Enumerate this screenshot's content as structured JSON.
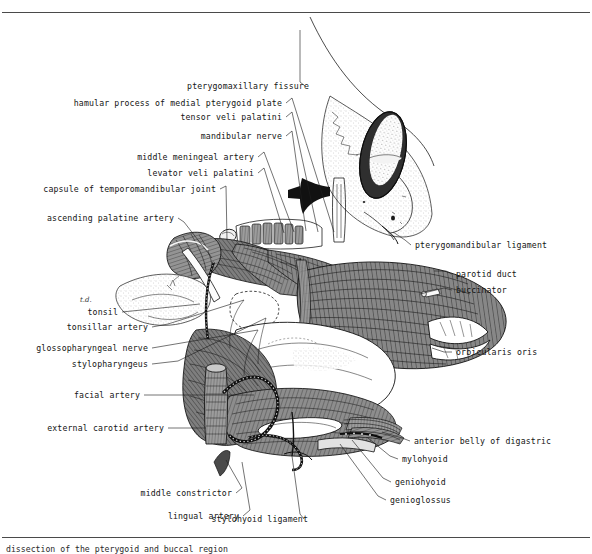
{
  "figure": {
    "top_rule": true,
    "bottom_rule": true,
    "caption": "dissection of the pterygoid and buccal region",
    "handwritten_note": "t.d.",
    "colors": {
      "ink": "#101010",
      "muscle_fill": "#8a8a8a",
      "muscle_dark": "#5f5f5f",
      "muscle_light": "#b4b4b4",
      "bone_stipple": "#cfcfcf",
      "bone_fill": "#fdfdfd",
      "vessel_dark": "#3a3a3a",
      "rule": "#4a4a4a",
      "label_text": "#141414"
    }
  },
  "labels_left": [
    {
      "id": "hamular-process-of-medial-pterygoid-plate",
      "text": "hamular process of medial pterygoid plate",
      "x": 282,
      "y": 106,
      "lead": "M286,103 L292,98 L334,232"
    },
    {
      "id": "tensor-veli-palatini",
      "text": "tensor veli palatini",
      "x": 282,
      "y": 120,
      "lead": "M286,117 L292,112 L318,232"
    },
    {
      "id": "mandibular-nerve",
      "text": "mandibular nerve",
      "x": 282,
      "y": 139,
      "lead": "M286,136 L292,131 L306,231"
    },
    {
      "id": "middle-meningeal-artery",
      "text": "middle meningeal artery",
      "x": 254,
      "y": 160,
      "lead": "M258,157 L264,152 L294,232"
    },
    {
      "id": "levator-veli-palatini",
      "text": "levator veli palatini",
      "x": 254,
      "y": 176,
      "lead": "M258,173 L264,168 L284,233"
    },
    {
      "id": "capsule-of-temporomandibular-joint",
      "text": "capsule of temporomandibular joint",
      "x": 216,
      "y": 192,
      "lead": "M220,189 L226,186 L227,240"
    },
    {
      "id": "ascending-palatine-artery",
      "text": "ascending palatine artery",
      "x": 174,
      "y": 221,
      "lead": "M178,218 L184,222 L212,258"
    },
    {
      "id": "tonsil",
      "text": "tonsil",
      "x": 118,
      "y": 315,
      "lead": "M122,312 L200,304"
    },
    {
      "id": "tonsillar-artery",
      "text": "tonsillar artery",
      "x": 148,
      "y": 330,
      "lead": "M152,327 L168,324 L244,300"
    },
    {
      "id": "glossopharyngeal-nerve",
      "text": "glossopharyngeal nerve",
      "x": 148,
      "y": 351,
      "lead": "M152,348 L258,330"
    },
    {
      "id": "stylopharyngeus",
      "text": "stylopharyngeus",
      "x": 148,
      "y": 367,
      "lead": "M152,364 L178,361 L266,318"
    },
    {
      "id": "facial-artery",
      "text": "facial artery",
      "x": 140,
      "y": 398,
      "lead": "M144,395 L254,395"
    },
    {
      "id": "external-carotid-artery",
      "text": "external carotid artery",
      "x": 164,
      "y": 431,
      "lead": "M168,428 L206,428"
    }
  ],
  "labels_top": [
    {
      "id": "pterygomaxillary-fissure",
      "text": "pterygomaxillary fissure",
      "x": 309,
      "y": 89,
      "lead": "M305,86 L300,82 L300,30"
    }
  ],
  "labels_right": [
    {
      "id": "pterygomandibular-ligament",
      "text": "pterygomandibular ligament",
      "x": 415,
      "y": 248,
      "lead": "M411,245 L405,240 L393,232"
    },
    {
      "id": "parotid-duct",
      "text": "parotid duct",
      "x": 456,
      "y": 277,
      "lead": "M452,274 L446,271 L434,271"
    },
    {
      "id": "buccinator",
      "text": "buccinator",
      "x": 456,
      "y": 293,
      "lead": "M452,290 L444,288 L420,294"
    },
    {
      "id": "orbicularis-oris",
      "text": "orbicularis oris",
      "x": 456,
      "y": 355,
      "lead": "M452,352 L444,352 L432,348"
    },
    {
      "id": "anterior-belly-of-digastric",
      "text": "anterior belly of digastric",
      "x": 414,
      "y": 444,
      "lead": "M410,441 L402,438 L382,432"
    },
    {
      "id": "mylohyoid",
      "text": "mylohyoid",
      "x": 402,
      "y": 462,
      "lead": "M398,459 L390,456 L368,438"
    },
    {
      "id": "geniohyoid",
      "text": "geniohyoid",
      "x": 395,
      "y": 485,
      "lead": "M391,482 L383,478 L352,440"
    },
    {
      "id": "geniogloss",
      "text": "genioglossus",
      "x": 390,
      "y": 503,
      "lead": "M386,500 L378,496 L340,444"
    }
  ],
  "labels_bottom": [
    {
      "id": "middle-constrictor",
      "text": "middle constrictor",
      "x": 232,
      "y": 496,
      "lead": "M236,493 L242,488 L226,460"
    },
    {
      "id": "lingual-artery",
      "text": "lingual artery",
      "x": 239,
      "y": 519,
      "lead": "M243,516 L250,510 L242,462"
    },
    {
      "id": "stylohyoid-ligament",
      "text": "stylohyoid ligament",
      "x": 308,
      "y": 522,
      "lead": "M304,519 L300,514 L292,456"
    }
  ]
}
